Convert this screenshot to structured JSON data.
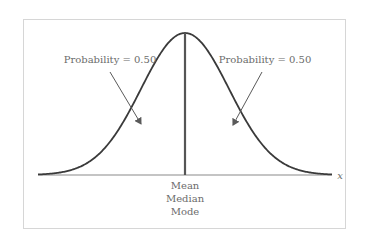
{
  "chart_data": {
    "type": "line",
    "title": "",
    "xlabel": "x",
    "ylabel": "",
    "grid": false,
    "legend": null,
    "series": [
      {
        "name": "Normal density curve",
        "x": [
          -3.0,
          -2.5,
          -2.0,
          -1.5,
          -1.0,
          -0.5,
          0.0,
          0.5,
          1.0,
          1.5,
          2.0,
          2.5,
          3.0
        ],
        "values": [
          0.004,
          0.018,
          0.054,
          0.13,
          0.242,
          0.352,
          0.399,
          0.352,
          0.242,
          0.13,
          0.054,
          0.018,
          0.004
        ]
      }
    ],
    "center_line": {
      "x": 0,
      "labels": [
        "Mean",
        "Median",
        "Mode"
      ]
    },
    "annotations": [
      {
        "text": "Probability = 0.50",
        "side": "left",
        "area": 0.5
      },
      {
        "text": "Probability = 0.50",
        "side": "right",
        "area": 0.5
      }
    ]
  },
  "labels": {
    "left_probability": "Probability = 0.50",
    "right_probability": "Probability = 0.50",
    "axis_x": "x",
    "center": [
      "Mean",
      "Median",
      "Mode"
    ]
  },
  "colors": {
    "curve": "#3a3a3a",
    "center_line": "#555555",
    "axis": "#7a7a7a",
    "frame": "#d6d6d6",
    "text": "#6b6b6b",
    "arrow": "#5a5a5a"
  }
}
